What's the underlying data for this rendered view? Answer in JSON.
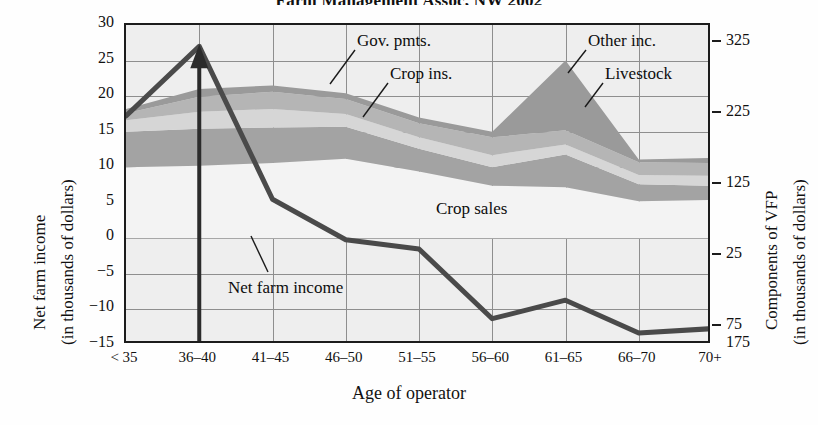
{
  "chart_data": {
    "type": "area",
    "title": "Farm Management Assoc, NW 2002",
    "xlabel": "Age of operator",
    "ylabel_left_line1": "Net farm income",
    "ylabel_left_line2": "(in thousands of dollars)",
    "ylabel_right_line1": "Components of VFP",
    "ylabel_right_line2": "(in thousands of dollars)",
    "categories": [
      "< 35",
      "36–40",
      "41–45",
      "46–50",
      "51–55",
      "56–60",
      "61–65",
      "66–70",
      "70+"
    ],
    "ylim_left": [
      -15,
      30
    ],
    "yticks_left": [
      "30",
      "25",
      "20",
      "15",
      "10",
      "5",
      "0",
      "−5",
      "−10",
      "−15"
    ],
    "ylim_right": [
      -175,
      325
    ],
    "yticks_right": [
      "325",
      "225",
      "125",
      "25",
      "75",
      "175"
    ],
    "grid": true,
    "legend": "in-plot annotations",
    "series": [
      {
        "name": "Crop sales",
        "label": "Crop sales",
        "color": "#f3f3f3",
        "values": [
          10.0,
          10.2,
          10.6,
          11.2,
          9.4,
          7.4,
          7.2,
          5.2,
          5.4
        ]
      },
      {
        "name": "Livestock",
        "label": "Livestock",
        "color": "#a3a3a3",
        "values": [
          5.0,
          5.2,
          5.0,
          4.5,
          3.2,
          2.6,
          4.6,
          2.4,
          2.0
        ]
      },
      {
        "name": "Crop ins.",
        "label": "Crop ins.",
        "color": "#d6d6d6",
        "values": [
          1.6,
          2.4,
          2.6,
          1.8,
          1.6,
          1.7,
          1.4,
          1.3,
          1.4
        ]
      },
      {
        "name": "Gov. pmts.",
        "label": "Gov. pmts.",
        "color": "#b5b5b5",
        "values": [
          1.0,
          2.1,
          2.4,
          2.1,
          2.0,
          2.5,
          2.0,
          1.8,
          1.8
        ]
      },
      {
        "name": "Other inc.",
        "label": "Other inc.",
        "color": "#9a9a9a",
        "values": [
          0.6,
          1.1,
          0.9,
          0.8,
          0.8,
          0.8,
          9.8,
          0.4,
          0.7
        ]
      }
    ],
    "line_series": {
      "name": "Net farm income",
      "label": "Net farm income",
      "color": "#4a4a4a",
      "values": [
        17.2,
        27.0,
        5.5,
        -0.2,
        -1.5,
        -11.3,
        -8.7,
        -13.3,
        -12.7
      ]
    },
    "annotations": [
      {
        "text": "Gov. pmts.",
        "target": "gov-pmts-band"
      },
      {
        "text": "Crop ins.",
        "target": "crop-ins-band"
      },
      {
        "text": "Other inc.",
        "target": "other-inc-band"
      },
      {
        "text": "Livestock",
        "target": "livestock-band"
      },
      {
        "text": "Crop sales",
        "target": "crop-sales-band"
      },
      {
        "text": "Net farm income",
        "target": "net-farm-income-line"
      }
    ],
    "marker_arrow": {
      "at_category": "36–40",
      "direction": "up",
      "note": "vertical callout arrow"
    }
  }
}
